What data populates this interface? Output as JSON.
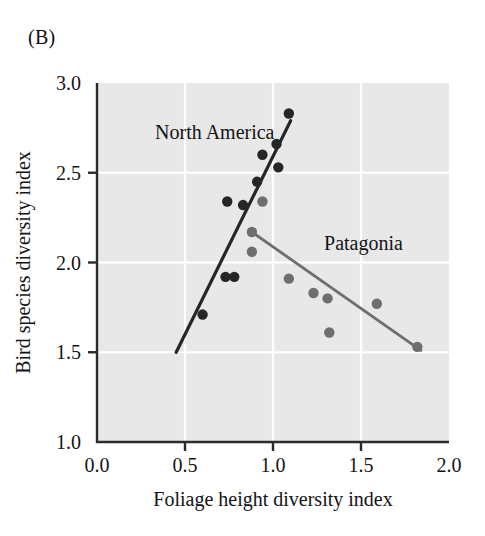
{
  "panel": {
    "label": "(B)"
  },
  "chart_data": {
    "type": "scatter",
    "title": "",
    "xlabel": "Foliage height diversity index",
    "ylabel": "Bird species diversity index",
    "xlim": [
      0.0,
      2.0
    ],
    "ylim": [
      1.0,
      3.0
    ],
    "xticks": [
      "0.0",
      "0.5",
      "1.0",
      "1.5",
      "2.0"
    ],
    "xtick_values": [
      0.0,
      0.5,
      1.0,
      1.5,
      2.0
    ],
    "yticks": [
      "1.0",
      "1.5",
      "2.0",
      "2.5",
      "3.0"
    ],
    "ytick_values": [
      1.0,
      1.5,
      2.0,
      2.5,
      3.0
    ],
    "grid": true,
    "grid_color": "#ffffff",
    "plot_background": "#e8e8e8",
    "legend_position": "inline-annotation",
    "series": [
      {
        "name": "North America",
        "color": "#262626",
        "marker": "circle",
        "label_x": 0.33,
        "label_y": 2.69,
        "points": [
          {
            "x": 0.6,
            "y": 1.71
          },
          {
            "x": 0.73,
            "y": 1.92
          },
          {
            "x": 0.78,
            "y": 1.92
          },
          {
            "x": 0.74,
            "y": 2.34
          },
          {
            "x": 0.83,
            "y": 2.32
          },
          {
            "x": 0.91,
            "y": 2.45
          },
          {
            "x": 0.94,
            "y": 2.6
          },
          {
            "x": 1.02,
            "y": 2.66
          },
          {
            "x": 1.03,
            "y": 2.53
          },
          {
            "x": 1.09,
            "y": 2.83
          }
        ],
        "trendline": {
          "x1": 0.45,
          "y1": 1.5,
          "x2": 1.1,
          "y2": 2.79
        }
      },
      {
        "name": "Patagonia",
        "color": "#6e6e6e",
        "marker": "circle",
        "label_x": 1.29,
        "label_y": 2.07,
        "points": [
          {
            "x": 0.94,
            "y": 2.34
          },
          {
            "x": 0.88,
            "y": 2.17
          },
          {
            "x": 0.88,
            "y": 2.06
          },
          {
            "x": 1.09,
            "y": 1.91
          },
          {
            "x": 1.23,
            "y": 1.83
          },
          {
            "x": 1.31,
            "y": 1.8
          },
          {
            "x": 1.32,
            "y": 1.61
          },
          {
            "x": 1.59,
            "y": 1.77
          },
          {
            "x": 1.82,
            "y": 1.53
          }
        ],
        "trendline": {
          "x1": 0.88,
          "y1": 2.17,
          "x2": 1.84,
          "y2": 1.51
        }
      }
    ]
  }
}
